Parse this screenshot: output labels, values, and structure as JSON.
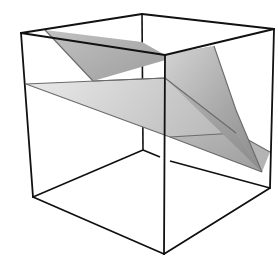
{
  "figure": {
    "type": "3d-cube-with-intersecting-planes",
    "colors": {
      "background": "#ffffff",
      "cube_edges": "#111111",
      "upper_plane_light": "#c8c8c8",
      "upper_plane_dark": "#8e8e8e",
      "lower_plane_light": "#e2e2e2",
      "lower_plane_dark": "#a9a9a9",
      "plane_edges": "#6a6a6a"
    },
    "cube": {
      "vertices": {
        "front_top_left": [
          21,
          33
        ],
        "front_top_right": [
          165,
          55
        ],
        "back_top_left": [
          142,
          14
        ],
        "back_top_right": [
          274,
          29
        ],
        "front_bottom_left": [
          33,
          197
        ],
        "front_bottom_right": [
          164,
          254
        ],
        "back_bottom_left": [
          143,
          150
        ],
        "back_bottom_right": [
          270,
          188
        ]
      }
    },
    "planes": [
      {
        "name": "upper-plane",
        "shade": "dark"
      },
      {
        "name": "lower-plane",
        "shade": "light"
      }
    ]
  }
}
